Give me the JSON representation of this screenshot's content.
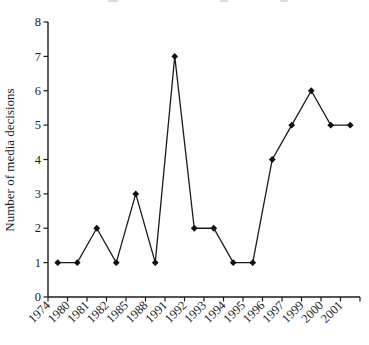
{
  "chart_data": {
    "type": "line",
    "title": "",
    "categories": [
      "1974",
      "1980",
      "1981",
      "1982",
      "1985",
      "1988",
      "1991",
      "1992",
      "1993",
      "1994",
      "1995",
      "1996",
      "1997",
      "1999",
      "2000",
      "2001"
    ],
    "values": [
      1,
      1,
      2,
      1,
      3,
      1,
      7,
      2,
      2,
      1,
      1,
      4,
      5,
      6,
      5,
      5
    ],
    "xlabel": "",
    "ylabel": "Number of media decisions",
    "ylim": [
      0,
      8
    ],
    "yticks": [
      0,
      1,
      2,
      3,
      4,
      5,
      6,
      7,
      8
    ],
    "grid": false,
    "legend": false,
    "marker": "diamond",
    "x_label_rotation": -45,
    "x_tick_style": "between-categories",
    "line_color": "#1b1b1b",
    "marker_color": "#111111",
    "axis_color": "#1b1b1b",
    "background_color": "#ffffff"
  }
}
